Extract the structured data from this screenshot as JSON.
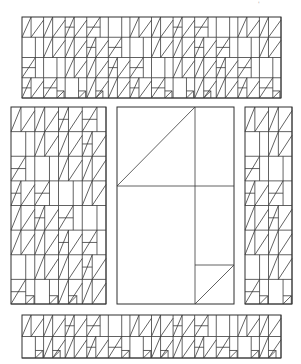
{
  "diagram": {
    "type": "quilt-block-layout",
    "colors": {
      "line": "#3a3a3a",
      "frame": "#2e2e2e",
      "background": "#ffffff"
    },
    "corner_mark": "'",
    "panels": [
      {
        "id": "top-strip",
        "x": 22,
        "y": 17,
        "w": 259,
        "h": 81,
        "pattern": "dense",
        "cols": 12,
        "rows": 4
      },
      {
        "id": "left-panel",
        "x": 11,
        "y": 107,
        "w": 95,
        "h": 197,
        "pattern": "dense",
        "cols": 4,
        "rows": 8
      },
      {
        "id": "center-panel",
        "x": 117,
        "y": 107,
        "w": 117,
        "h": 197,
        "pattern": "simple",
        "lines": [
          [
            195,
            107,
            195,
            304
          ],
          [
            117,
            186,
            234,
            186
          ],
          [
            117,
            186,
            195,
            107
          ],
          [
            195,
            265,
            234,
            265
          ],
          [
            195,
            304,
            234,
            265
          ]
        ]
      },
      {
        "id": "right-panel",
        "x": 245,
        "y": 107,
        "w": 47,
        "h": 197,
        "pattern": "dense",
        "cols": 2,
        "rows": 8
      },
      {
        "id": "bottom-strip",
        "x": 22,
        "y": 315,
        "w": 259,
        "h": 43,
        "pattern": "dense",
        "cols": 12,
        "rows": 2
      }
    ]
  }
}
